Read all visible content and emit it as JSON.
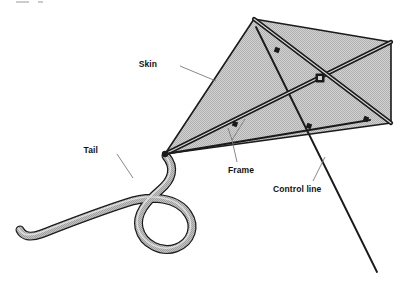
{
  "figure": {
    "type": "labeled-line-diagram",
    "background_color": "#ffffff",
    "line_color": "#1a1a1a",
    "sail_fill_color": "#c9c9c9",
    "tail_fill_color": "#b4b4b4",
    "leader_line_color": "#7a7a7a",
    "width": 410,
    "height": 293
  },
  "labels": [
    {
      "id": "skin",
      "text": "Skin",
      "text_x": 157,
      "text_y": 67,
      "leader_from_x": 180,
      "leader_from_y": 66,
      "leader_to_x": 216,
      "leader_to_y": 81
    },
    {
      "id": "tail",
      "text": "Tail",
      "text_x": 98,
      "text_y": 153,
      "leader_from_x": 117,
      "leader_from_y": 154,
      "leader_to_x": 133,
      "leader_to_y": 178
    },
    {
      "id": "frame",
      "text": "Frame",
      "text_x": 228,
      "text_y": 170,
      "leader_from_x": 237,
      "leader_from_y": 162,
      "leader_to_x": 228,
      "leader_to_y": 131,
      "leader_branch_x": 245,
      "leader_branch_y": 119
    },
    {
      "id": "control-line",
      "text": "Control line",
      "text_x": 273,
      "text_y": 189,
      "leader_from_x": 313,
      "leader_from_y": 181,
      "leader_to_x": 325,
      "leader_to_y": 157
    }
  ],
  "kite": {
    "sail_vertices": [
      {
        "name": "nose",
        "x": 165,
        "y": 154
      },
      {
        "name": "top",
        "x": 254,
        "y": 19
      },
      {
        "name": "right-top",
        "x": 391,
        "y": 42
      },
      {
        "name": "right-bottom",
        "x": 391,
        "y": 123
      }
    ],
    "hub": {
      "x": 320,
      "y": 78,
      "size": 5
    },
    "spars": [
      {
        "name": "spar-nose-to-right-top",
        "from_x": 165,
        "from_y": 154,
        "to_x": 391,
        "to_y": 42
      },
      {
        "name": "spar-top-to-right-bottom",
        "from_x": 254,
        "from_y": 19,
        "to_x": 391,
        "to_y": 123
      },
      {
        "name": "cross-member",
        "from_x": 165,
        "from_y": 154,
        "to_x": 370,
        "to_y": 120
      }
    ],
    "joints": [
      {
        "name": "joint-upper-left",
        "x": 277,
        "y": 50
      },
      {
        "name": "joint-lower-left",
        "x": 235,
        "y": 124
      },
      {
        "name": "joint-lower-right",
        "x": 366,
        "y": 119
      },
      {
        "name": "joint-mid-lower",
        "x": 309,
        "y": 126
      }
    ],
    "control_line": {
      "from_x": 256,
      "from_y": 27,
      "to_x": 377,
      "to_y": 272
    },
    "tail_path": "M 166,156 C 176,168 172,180 160,190 C 146,202 136,214 139,228 C 143,245 162,253 176,248 C 192,242 196,226 188,214 C 178,198 152,194 126,203 C 92,214 62,226 41,234 C 30,238 23,236 20,230"
  }
}
